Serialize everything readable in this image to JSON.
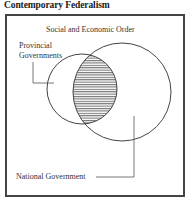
{
  "title": "Contemporary Federalism",
  "diagram": {
    "frame_label": "Social and Economic Order",
    "sets": [
      {
        "name": "Provincial Governments",
        "label_lines": [
          "Provincial",
          "Governments"
        ],
        "circle": {
          "cx": 82,
          "cy": 89,
          "r": 35
        }
      },
      {
        "name": "National Government",
        "label_lines": [
          "National Government"
        ],
        "circle": {
          "cx": 122,
          "cy": 92,
          "r": 49
        }
      }
    ],
    "overlap": {
      "fill": "horizontal-hatch",
      "between": [
        "Provincial Governments",
        "National Government"
      ]
    },
    "colors": {
      "stroke": "#444444",
      "frame": "#444444",
      "text": "#333333",
      "hatch": "#555555"
    }
  }
}
